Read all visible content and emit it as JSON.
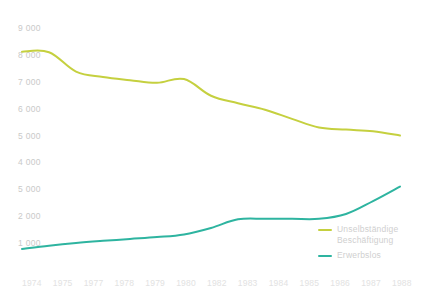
{
  "chart_data": {
    "type": "line",
    "title": "",
    "subtitle": "",
    "xlabel": "",
    "ylabel": "",
    "x": [
      1974,
      1975,
      1976,
      1977,
      1978,
      1979,
      1980,
      1981,
      1982,
      1983,
      1984,
      1985,
      1986,
      1987,
      1988
    ],
    "xtick_labels": [
      "1974",
      "1975",
      "1977",
      "1978",
      "1979",
      "1980",
      "1982",
      "1983",
      "1984",
      "1985",
      "1986",
      "1987",
      "1988"
    ],
    "ytick_labels": [
      "9 000",
      "8 000",
      "7 000",
      "6 000",
      "5 000",
      "4 000",
      "5 000",
      "2 000",
      "1 000"
    ],
    "ytick_values": [
      9000,
      8000,
      7000,
      6000,
      5000,
      4000,
      3000,
      2000,
      1000
    ],
    "ylim": [
      0,
      9000
    ],
    "xlim": [
      1974,
      1988
    ],
    "grid": false,
    "legend_position": "bottom-right",
    "series": [
      {
        "name": "Unselbständige Beschäftigung",
        "color": "#c5d03f",
        "values": [
          8120,
          8100,
          7380,
          7180,
          7060,
          6960,
          7100,
          6480,
          6200,
          5960,
          5620,
          5300,
          5220,
          5160,
          5000
        ]
      },
      {
        "name": "Erwerbslos",
        "color": "#2eb4a0",
        "values": [
          780,
          900,
          1000,
          1080,
          1150,
          1220,
          1320,
          1560,
          1880,
          1900,
          1900,
          1900,
          2080,
          2560,
          3100
        ]
      }
    ]
  },
  "legend": {
    "entries": [
      {
        "label_line1": "Unselbständige",
        "label_line2": "Beschäftigung",
        "color": "#c5d03f"
      },
      {
        "label_line1": "Erwerbslos",
        "label_line2": "",
        "color": "#2eb4a0"
      }
    ]
  }
}
